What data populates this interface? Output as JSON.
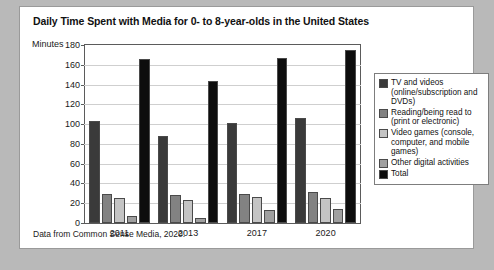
{
  "figure": {
    "title": "Daily Time Spent with Media for 0- to 8-year-olds in the United States",
    "source_note": "Data from Common Sense Media, 2020.",
    "y_axis_title": "Minutes"
  },
  "chart_data": {
    "type": "bar",
    "title": "Daily Time Spent with Media for 0- to 8-year-olds in the United States",
    "xlabel": "",
    "ylabel": "Minutes",
    "ylim": [
      0,
      180
    ],
    "yticks": [
      0,
      20,
      40,
      60,
      80,
      100,
      120,
      140,
      160,
      180
    ],
    "grid": true,
    "legend_position": "right",
    "categories": [
      "2011",
      "2013",
      "2017",
      "2020"
    ],
    "series": [
      {
        "name": "TV and videos (online/subscription and DVDs)",
        "color": "#3a3a3a",
        "values": [
          103,
          88,
          101,
          106
        ]
      },
      {
        "name": "Reading/being read to (print or electronic)",
        "color": "#828282",
        "values": [
          29,
          28,
          29,
          31
        ]
      },
      {
        "name": "Video games (console, computer, and mobile games)",
        "color": "#c4c4c4",
        "values": [
          25,
          23,
          26,
          25
        ]
      },
      {
        "name": "Other digital activities",
        "color": "#a0a0a0",
        "values": [
          7,
          5,
          13,
          14
        ]
      },
      {
        "name": "Total",
        "color": "#0d0d0d",
        "values": [
          166,
          144,
          167,
          175
        ]
      }
    ],
    "annotations": []
  },
  "legend": {
    "items": [
      {
        "label": "TV and videos (online/subscription and DVDs)",
        "color": "#3a3a3a"
      },
      {
        "label": "Reading/being read to (print or electronic)",
        "color": "#828282"
      },
      {
        "label": "Video games (console, computer, and mobile games)",
        "color": "#c4c4c4"
      },
      {
        "label": "Other digital activities",
        "color": "#a0a0a0"
      },
      {
        "label": "Total",
        "color": "#0d0d0d"
      }
    ]
  }
}
